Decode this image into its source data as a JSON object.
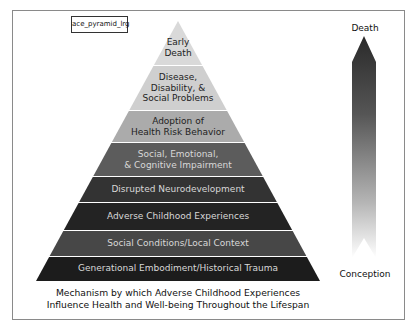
{
  "figure": {
    "tag_label": "ace_pyramid_lrg",
    "caption_line1": "Mechanism by which Adverse Childhood Experiences",
    "caption_line2": "Influence Health and Well-being Throughout the Lifespan"
  },
  "pyramid": {
    "levels": [
      {
        "line1": "Early",
        "line2": "Death",
        "fill": "#d9d9d9"
      },
      {
        "line1": "Disease,",
        "line2": "Disability, &",
        "line3": "Social Problems",
        "fill": "#cfcfcf"
      },
      {
        "line1": "Adoption of",
        "line2": "Health Risk Behavior",
        "fill": "#ababab"
      },
      {
        "line1": "Social, Emotional,",
        "line2": "& Cognitive Impairment",
        "fill": "#5c5c5c"
      },
      {
        "line1": "Disrupted Neurodevelopment",
        "fill": "#333333"
      },
      {
        "line1": "Adverse Childhood Experiences",
        "fill": "#232323"
      },
      {
        "line1": "Social Conditions/Local Context",
        "fill": "#474747"
      },
      {
        "line1": "Generational Embodiment/Historical Trauma",
        "fill": "#1c1c1c"
      }
    ]
  },
  "lifespan_arrow": {
    "top_label": "Death",
    "bottom_label": "Conception"
  }
}
